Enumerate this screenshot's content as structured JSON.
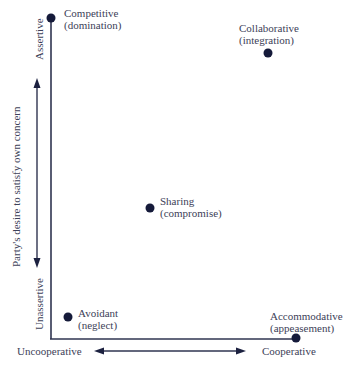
{
  "diagram": {
    "type": "conflict-styles-grid",
    "y_axis": {
      "title": "Party's desire to satisfy own concern",
      "top_label": "Assertive",
      "bottom_label": "Unassertive"
    },
    "x_axis": {
      "left_label": "Uncooperative",
      "right_label": "Cooperative"
    },
    "points": [
      {
        "name": "Competitive",
        "sub": "(domination)"
      },
      {
        "name": "Collaborative",
        "sub": "(integration)"
      },
      {
        "name": "Sharing",
        "sub": "(compromise)"
      },
      {
        "name": "Avoidant",
        "sub": "(neglect)"
      },
      {
        "name": "Accommodative",
        "sub": "(appeasement)"
      }
    ],
    "colors": {
      "line": "#2f3450",
      "dot": "#151a3a",
      "text": "#3d4158"
    }
  }
}
